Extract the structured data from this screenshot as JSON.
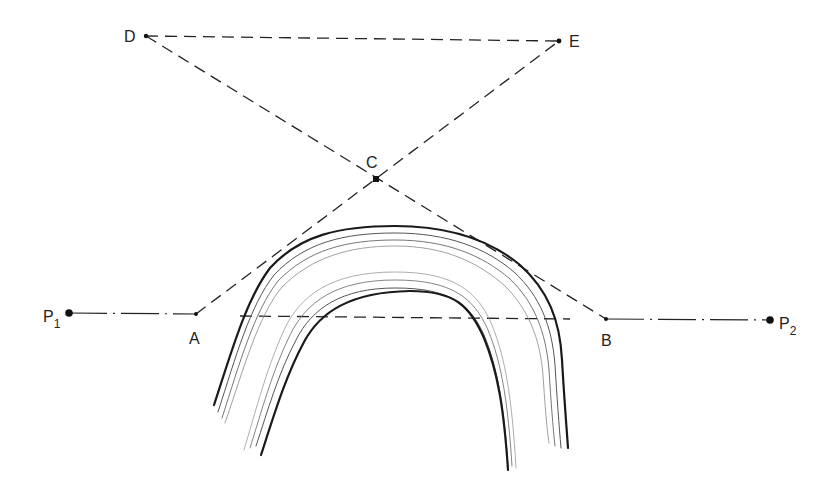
{
  "diagram": {
    "background": "#ffffff",
    "ink": "#1a1a1a",
    "points": [
      {
        "id": "D",
        "label": "D",
        "x": 146,
        "y": 36,
        "lx": 124,
        "ly": 42
      },
      {
        "id": "E",
        "label": "E",
        "x": 559,
        "y": 41,
        "lx": 569,
        "ly": 47
      },
      {
        "id": "C",
        "label": "C",
        "x": 376,
        "y": 179,
        "lx": 366,
        "ly": 168
      },
      {
        "id": "A",
        "label": "A",
        "x": 196,
        "y": 314,
        "lx": 189,
        "ly": 344
      },
      {
        "id": "B",
        "label": "B",
        "x": 606,
        "y": 319,
        "lx": 601,
        "ly": 346
      },
      {
        "id": "P1",
        "label": "P",
        "sub": "1",
        "x": 69,
        "y": 313,
        "lx": 43,
        "ly": 322
      },
      {
        "id": "P2",
        "label": "P",
        "sub": "2",
        "x": 770,
        "y": 320,
        "lx": 779,
        "ly": 329
      }
    ],
    "lines": {
      "dashed": [
        {
          "name": "line-D-E",
          "from": "D",
          "to": "E"
        },
        {
          "name": "line-D-B",
          "from": "D",
          "to": "B"
        },
        {
          "name": "line-A-E",
          "from": "A",
          "to": "E"
        },
        {
          "name": "chord-line",
          "x1": 240,
          "y1": 316,
          "x2": 570,
          "y2": 319
        }
      ],
      "dash_dot": [
        {
          "name": "line-P1-A",
          "from": "P1",
          "to": "A"
        },
        {
          "name": "line-B-P2",
          "from": "B",
          "to": "P2"
        }
      ]
    },
    "arch": {
      "description": "meandering channel bands (outer and inner banks)"
    }
  }
}
